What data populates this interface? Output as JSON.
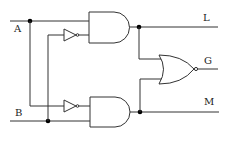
{
  "diagram": {
    "type": "logic-circuit",
    "inputs": [
      {
        "label": "A"
      },
      {
        "label": "B"
      }
    ],
    "outputs": [
      {
        "label": "L"
      },
      {
        "label": "G"
      },
      {
        "label": "M"
      }
    ],
    "gates": [
      {
        "id": "and-top",
        "type": "AND",
        "inputs": [
          "A",
          "buffer(B)"
        ],
        "output": "L"
      },
      {
        "id": "and-bottom",
        "type": "AND",
        "inputs": [
          "buffer(A)",
          "B"
        ],
        "output": "M"
      },
      {
        "id": "or",
        "type": "OR",
        "inputs": [
          "L",
          "M"
        ],
        "output": "G",
        "inverted_output": true
      },
      {
        "id": "buffer-top",
        "type": "BUFFER",
        "input": "B"
      },
      {
        "id": "buffer-bottom",
        "type": "BUFFER",
        "input": "A"
      }
    ],
    "colors": {
      "wire": "#333333",
      "background": "#ffffff"
    }
  }
}
